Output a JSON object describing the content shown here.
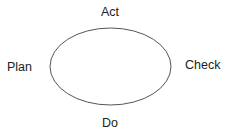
{
  "diagram": {
    "type": "cycle",
    "labels": {
      "top": "Act",
      "left": "Plan",
      "right": "Check",
      "bottom": "Do"
    },
    "stroke_color": "#555555"
  }
}
